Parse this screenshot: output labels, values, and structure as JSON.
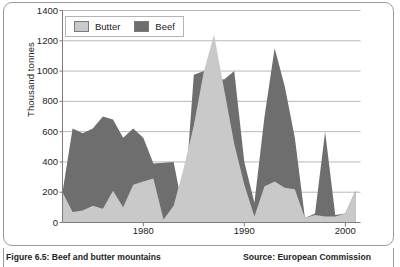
{
  "figure": {
    "caption": "Figure 6.5: Beef and butter mountains",
    "source": "Source: European Commission"
  },
  "legend": {
    "items": [
      {
        "label": "Butter",
        "color": "#c9c9c9"
      },
      {
        "label": "Beef",
        "color": "#6e6e6e"
      }
    ]
  },
  "chart_data": {
    "type": "area",
    "title": "",
    "subtitle": "",
    "xlabel": "",
    "ylabel": "Thousand tonnes",
    "xlim": [
      1972,
      2001.5
    ],
    "ylim": [
      0,
      1400
    ],
    "ytick_labels": [
      "0",
      "200",
      "400",
      "600",
      "800",
      "1000",
      "1200",
      "1400"
    ],
    "yticks": [
      0,
      200,
      400,
      600,
      800,
      1000,
      1200,
      1400
    ],
    "xtick_labels": [
      "1980",
      "1990",
      "2000"
    ],
    "xticks": [
      1980,
      1990,
      2000
    ],
    "grid": "horizontal",
    "legend_position": "top-left",
    "overlap": "layered",
    "x": [
      1972,
      1973,
      1974,
      1975,
      1976,
      1977,
      1978,
      1979,
      1980,
      1981,
      1982,
      1983,
      1984,
      1985,
      1986,
      1987,
      1988,
      1989,
      1990,
      1991,
      1992,
      1993,
      1994,
      1995,
      1996,
      1997,
      1998,
      1999,
      2000,
      2001
    ],
    "series": [
      {
        "name": "Beef",
        "color": "#6e6e6e",
        "values": [
          200,
          620,
          590,
          620,
          700,
          680,
          560,
          620,
          560,
          390,
          395,
          400,
          60,
          975,
          1000,
          950,
          945,
          1000,
          400,
          130,
          700,
          1150,
          900,
          560,
          30,
          60,
          600,
          50,
          60,
          210
        ]
      },
      {
        "name": "Butter",
        "color": "#c9c9c9",
        "values": [
          200,
          70,
          80,
          110,
          90,
          210,
          100,
          250,
          270,
          290,
          20,
          110,
          360,
          640,
          1000,
          1240,
          880,
          520,
          250,
          40,
          240,
          270,
          230,
          220,
          30,
          50,
          40,
          40,
          60,
          210
        ]
      }
    ]
  }
}
